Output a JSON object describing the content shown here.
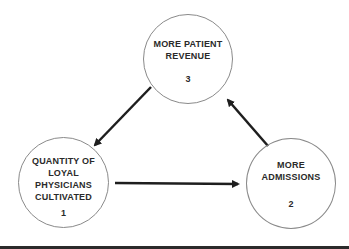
{
  "diagram": {
    "nodes": [
      {
        "id": 1,
        "label": "QUANTITY OF\nLOYAL PHYSICIANS\nCULTIVATED",
        "number": "1"
      },
      {
        "id": 2,
        "label": "MORE\nADMISSIONS",
        "number": "2"
      },
      {
        "id": 3,
        "label": "MORE PATIENT\nREVENUE",
        "number": "3"
      }
    ],
    "edges": [
      {
        "from": "1",
        "to": "2"
      },
      {
        "from": "2",
        "to": "3"
      },
      {
        "from": "3",
        "to": "1"
      }
    ],
    "colors": {
      "arrow": "#1e1e1e",
      "circle": "#8a8a8a",
      "text": "#2a2a2a",
      "rule": "#2b2b2b"
    }
  }
}
